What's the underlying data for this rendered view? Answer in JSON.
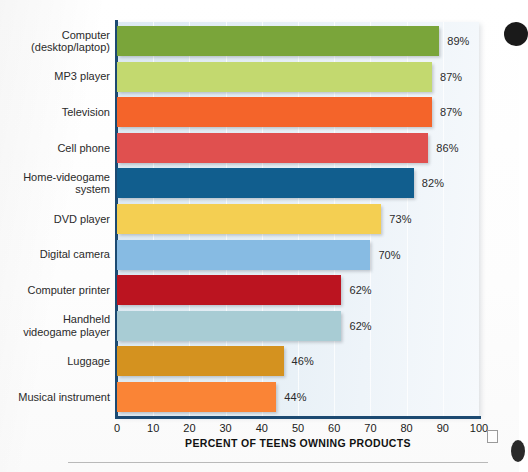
{
  "chart_data": {
    "type": "bar",
    "orientation": "horizontal",
    "title": "",
    "xlabel": "PERCENT OF TEENS OWNING PRODUCTS",
    "ylabel": "",
    "xlim": [
      0,
      100
    ],
    "xticks": [
      "0",
      "10",
      "20",
      "30",
      "40",
      "50",
      "60",
      "70",
      "80",
      "90",
      "100"
    ],
    "grid": "vertical",
    "legend": "none",
    "value_suffix": "%",
    "categories": [
      "Computer\n(desktop/laptop)",
      "MP3 player",
      "Television",
      "Cell phone",
      "Home-videogame\nsystem",
      "DVD player",
      "Digital camera",
      "Computer printer",
      "Handheld\nvideogame player",
      "Luggage",
      "Musical instrument"
    ],
    "values": [
      89,
      87,
      87,
      86,
      82,
      73,
      70,
      62,
      62,
      46,
      44
    ],
    "value_labels": [
      "89%",
      "87%",
      "87%",
      "86%",
      "82%",
      "73%",
      "70%",
      "62%",
      "62%",
      "46%",
      "44%"
    ],
    "bar_colors": [
      "#7aa53a",
      "#c3d96f",
      "#f4642a",
      "#e0504f",
      "#115e8e",
      "#f4cf52",
      "#87bbe3",
      "#bb1420",
      "#a8ccd4",
      "#d4921f",
      "#fa8436"
    ]
  },
  "style": {
    "axis_color": "#1c4a72",
    "panel_color": "#e4eef5",
    "text_color": "#2a2a2a"
  }
}
